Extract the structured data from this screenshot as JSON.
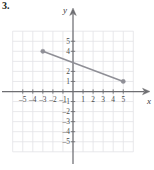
{
  "exercise": {
    "number_label": "3."
  },
  "axes": {
    "x_axis_label": "x",
    "y_axis_label": "y",
    "x_ticks": [
      {
        "value": -5,
        "label": "-5"
      },
      {
        "value": -4,
        "label": "-4"
      },
      {
        "value": -3,
        "label": "-3"
      },
      {
        "value": -2,
        "label": "-2"
      },
      {
        "value": -1,
        "label": "-1"
      },
      {
        "value": 1,
        "label": "1"
      },
      {
        "value": 2,
        "label": "2"
      },
      {
        "value": 3,
        "label": "3"
      },
      {
        "value": 4,
        "label": "4"
      },
      {
        "value": 5,
        "label": "5"
      }
    ],
    "y_ticks": [
      {
        "value": 5,
        "label": "5"
      },
      {
        "value": 4,
        "label": "4"
      },
      {
        "value": 2,
        "label": "2"
      },
      {
        "value": 1,
        "label": "1"
      },
      {
        "value": -1,
        "label": "-1"
      },
      {
        "value": -2,
        "label": "-2"
      },
      {
        "value": -3,
        "label": "-3"
      },
      {
        "value": -4,
        "label": "-4"
      },
      {
        "value": -5,
        "label": "-5"
      }
    ]
  },
  "colors": {
    "grid": "#e2e2e6",
    "axis": "#6e6e72",
    "line": "#8f8f96",
    "point": "#8f8f96",
    "text": "#4a4a4a",
    "background": "#ffffff"
  },
  "chart_data": {
    "type": "line",
    "title": "",
    "xlabel": "x",
    "ylabel": "y",
    "xlim": [
      -6.2,
      6.6
    ],
    "ylim": [
      -6.0,
      6.2
    ],
    "grid": true,
    "legend": "none",
    "xticks": [
      -5,
      -4,
      -3,
      -2,
      -1,
      1,
      2,
      3,
      4,
      5
    ],
    "yticks": [
      5,
      4,
      2,
      1,
      -1,
      -2,
      -3,
      -4,
      -5
    ],
    "series": [
      {
        "name": "segment",
        "x": [
          -3,
          5
        ],
        "y": [
          4,
          1
        ],
        "endpoints_marked": true,
        "slope": -0.375,
        "y_intercept": 2.875
      }
    ],
    "annotations": []
  }
}
